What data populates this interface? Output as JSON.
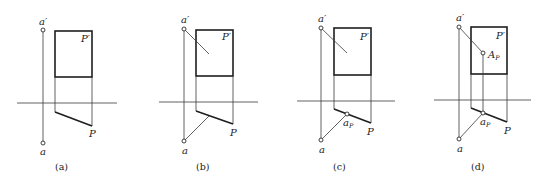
{
  "figure": {
    "panels": [
      {
        "id": "a",
        "caption": "(a)",
        "labels": {
          "a_prime": "a′",
          "a": "a",
          "P_prime": "P′",
          "P": "P"
        }
      },
      {
        "id": "b",
        "caption": "(b)",
        "labels": {
          "a_prime": "a′",
          "a": "a",
          "P_prime": "P′",
          "P": "P"
        }
      },
      {
        "id": "c",
        "caption": "(c)",
        "labels": {
          "a_prime": "a′",
          "a": "a",
          "P_prime": "P′",
          "P": "P",
          "aP_main": "a",
          "aP_sub": "P"
        }
      },
      {
        "id": "d",
        "caption": "(d)",
        "labels": {
          "a_prime": "a′",
          "a": "a",
          "P_prime": "P′",
          "P": "P",
          "aP_main": "a",
          "aP_sub": "P",
          "AP_main": "A",
          "AP_sub": "P"
        }
      }
    ]
  }
}
